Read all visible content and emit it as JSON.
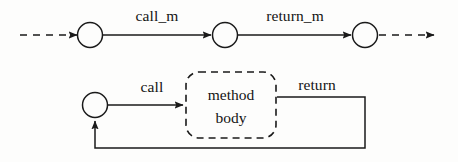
{
  "diagram": {
    "type": "state-transition-diagram",
    "colors": {
      "stroke": "#1a1a1a",
      "text": "#141414",
      "background": "#fdfdfc"
    },
    "upper_row": {
      "name": "method-call-sequence",
      "entry_arrow": {
        "style": "dashed",
        "label": ""
      },
      "nodes": [
        {
          "id": "state-1",
          "label": "",
          "cx": 90,
          "cy": 35,
          "r": 12
        },
        {
          "id": "state-2",
          "label": "",
          "cx": 225,
          "cy": 35,
          "r": 12
        },
        {
          "id": "state-3",
          "label": "",
          "cx": 365,
          "cy": 35,
          "r": 12
        }
      ],
      "transitions": [
        {
          "id": "transition-call-m",
          "label": "call_m",
          "from": "state-1",
          "to": "state-2",
          "style": "solid"
        },
        {
          "id": "transition-return-m",
          "label": "return_m",
          "from": "state-2",
          "to": "state-3",
          "style": "solid"
        }
      ],
      "exit_arrow": {
        "style": "dashed",
        "label": ""
      }
    },
    "lower_row": {
      "name": "method-body-expansion",
      "nodes": [
        {
          "id": "state-caller",
          "label": "",
          "cx": 95,
          "cy": 105,
          "r": 12
        }
      ],
      "body_box": {
        "id": "method-body-box",
        "line1": "method",
        "line2": "body",
        "style": "dashed-rounded"
      },
      "transitions": [
        {
          "id": "transition-call",
          "label": "call",
          "style": "solid"
        },
        {
          "id": "transition-return",
          "label": "return",
          "style": "solid"
        }
      ]
    }
  }
}
